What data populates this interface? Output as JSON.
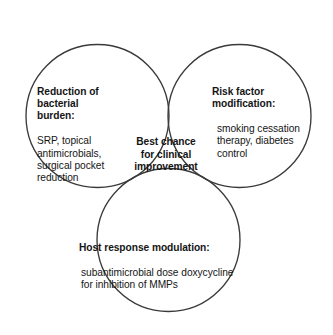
{
  "figure": {
    "type": "venn-diagram-3-set",
    "background_color": "#ffffff",
    "stroke_color": "#3a3a3a",
    "text_color": "#151515"
  },
  "sets": {
    "left": {
      "title": "Reduction of\nbacterial\nburden:",
      "body": "SRP, topical\nantimicrobials,\nsurgical pocket\nreduction"
    },
    "right": {
      "title": "Risk factor\nmodification:",
      "body": "smoking cessation\ntherapy, diabetes\ncontrol"
    },
    "bottom": {
      "title": "Host response modulation:",
      "body": "subantimicrobial dose doxycycline\nfor inhibition of MMPs"
    }
  },
  "intersection": {
    "label": "Best chance\nfor clinical\nimprovement"
  }
}
